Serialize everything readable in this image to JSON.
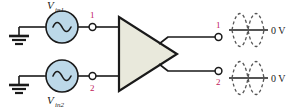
{
  "figure": {
    "colors": {
      "wire": "#1a1a1a",
      "source_fill": "#bcd8e8",
      "source_stroke": "#1a1a1a",
      "amp_fill": "#e9e9dc",
      "amp_stroke": "#1a1a1a",
      "node_red": "#c0185a",
      "node_dark": "#1a1a1a",
      "waveform": "#555555",
      "axis": "#555555",
      "background": "#ffffff"
    }
  },
  "sources": [
    {
      "id": "vin1",
      "label": "V",
      "subscript": "in1",
      "label_position": "above",
      "symbol": "sine-wave"
    },
    {
      "id": "vin2",
      "label": "V",
      "subscript": "in2",
      "label_position": "below",
      "symbol": "sine-wave"
    }
  ],
  "grounds": [
    {
      "id": "ground-top",
      "symbol": "earth-ground"
    },
    {
      "id": "ground-bottom",
      "symbol": "earth-ground"
    }
  ],
  "input_terminals": [
    {
      "id": "in-1",
      "label": "1",
      "color_key": "node_red"
    },
    {
      "id": "in-2",
      "label": "2",
      "color_key": "node_red"
    }
  ],
  "amplifier": {
    "id": "diff-amp",
    "shape": "triangle",
    "label": ""
  },
  "output_terminals": [
    {
      "id": "out-1",
      "label": "1",
      "color_key": "node_red"
    },
    {
      "id": "out-2",
      "label": "2",
      "color_key": "node_red"
    }
  ],
  "waveforms": [
    {
      "id": "waveform-out-1",
      "style": "dashed",
      "traces": 2,
      "cycles": 1,
      "phase_relationship": "antiphase",
      "axis_label": "0 V"
    },
    {
      "id": "waveform-out-2",
      "style": "dashed",
      "traces": 2,
      "cycles": 1,
      "phase_relationship": "antiphase",
      "axis_label": "0 V"
    }
  ]
}
